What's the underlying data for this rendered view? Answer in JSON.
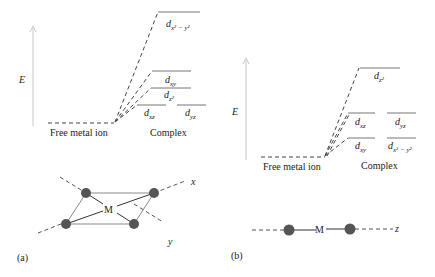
{
  "panel_a": {
    "tag": "(a)",
    "axis_label": "E",
    "free_ion_label": "Free metal ion",
    "complex_label": "Complex",
    "levels": [
      {
        "name": "dx2-y2",
        "d": "d",
        "sub": "x² − y²"
      },
      {
        "name": "dxy",
        "d": "d",
        "sub": "xy"
      },
      {
        "name": "dz2",
        "d": "d",
        "sub": "z²"
      },
      {
        "name": "dxz",
        "d": "d",
        "sub": "xz"
      },
      {
        "name": "dyz",
        "d": "d",
        "sub": "yz"
      }
    ],
    "geometry": {
      "center": "M",
      "axis_x": "x",
      "axis_y": "y"
    }
  },
  "panel_b": {
    "tag": "(b)",
    "axis_label": "E",
    "free_ion_label": "Free metal ion",
    "complex_label": "Complex",
    "levels": [
      {
        "name": "dz2",
        "d": "d",
        "sub": "z²"
      },
      {
        "name": "dxz",
        "d": "d",
        "sub": "xz"
      },
      {
        "name": "dyz",
        "d": "d",
        "sub": "yz"
      },
      {
        "name": "dxy",
        "d": "d",
        "sub": "xy"
      },
      {
        "name": "dx2-y2",
        "d": "d",
        "sub": "x² − y²"
      }
    ],
    "geometry": {
      "center": "M",
      "axis_z": "z"
    }
  }
}
